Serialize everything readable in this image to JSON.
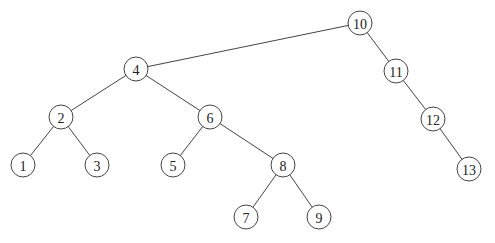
{
  "diagram": {
    "type": "binary-search-tree",
    "root": "10",
    "nodes": [
      {
        "id": "10",
        "label": "10",
        "x": 360,
        "y": 23
      },
      {
        "id": "4",
        "label": "4",
        "x": 136,
        "y": 69
      },
      {
        "id": "11",
        "label": "11",
        "x": 396,
        "y": 71
      },
      {
        "id": "2",
        "label": "2",
        "x": 61,
        "y": 117
      },
      {
        "id": "6",
        "label": "6",
        "x": 210,
        "y": 117
      },
      {
        "id": "12",
        "label": "12",
        "x": 433,
        "y": 119
      },
      {
        "id": "1",
        "label": "1",
        "x": 23,
        "y": 165
      },
      {
        "id": "3",
        "label": "3",
        "x": 97,
        "y": 165
      },
      {
        "id": "5",
        "label": "5",
        "x": 173,
        "y": 165
      },
      {
        "id": "8",
        "label": "8",
        "x": 283,
        "y": 165
      },
      {
        "id": "13",
        "label": "13",
        "x": 469,
        "y": 169
      },
      {
        "id": "7",
        "label": "7",
        "x": 246,
        "y": 217
      },
      {
        "id": "9",
        "label": "9",
        "x": 319,
        "y": 217
      }
    ],
    "edges": [
      [
        "10",
        "4"
      ],
      [
        "10",
        "11"
      ],
      [
        "4",
        "2"
      ],
      [
        "4",
        "6"
      ],
      [
        "2",
        "1"
      ],
      [
        "2",
        "3"
      ],
      [
        "6",
        "5"
      ],
      [
        "6",
        "8"
      ],
      [
        "8",
        "7"
      ],
      [
        "8",
        "9"
      ],
      [
        "11",
        "12"
      ],
      [
        "12",
        "13"
      ]
    ],
    "node_radius": 12
  }
}
